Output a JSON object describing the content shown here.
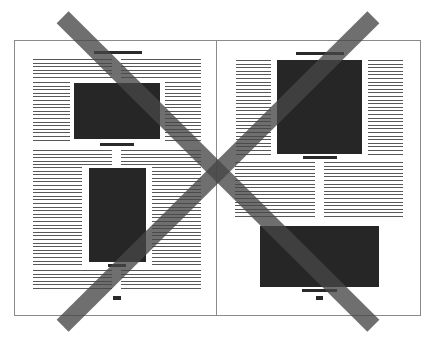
{
  "diagram": {
    "colors": {
      "background": "#ffffff",
      "page_border": "#8a8a8a",
      "image_block": "#262626",
      "text_lines": "#3a3a3a",
      "cross_mark": "#464646"
    },
    "left_page": {
      "elements": [
        "headline-bar",
        "text-columns",
        "image-landscape",
        "caption-bar",
        "image-portrait",
        "caption-bar",
        "page-number"
      ]
    },
    "right_page": {
      "elements": [
        "headline-bar",
        "image-portrait-large",
        "caption-bar",
        "text-columns",
        "image-landscape",
        "caption-bar",
        "page-number"
      ]
    },
    "cross_mark": {
      "type": "X",
      "meaning": "incorrect"
    }
  }
}
